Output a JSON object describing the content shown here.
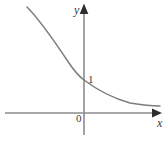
{
  "figure": {
    "width": 168,
    "height": 141,
    "background_color": "#ffffff"
  },
  "labels": {
    "y_axis": "y",
    "x_axis": "x",
    "y_intercept": "1",
    "origin": "0"
  },
  "colors": {
    "axis": "#8c8c8c",
    "arrow": "#2e2e2e",
    "curve": "#7d7d7d",
    "text": "#3a3a3a"
  },
  "chart_data": {
    "type": "line",
    "title": "",
    "subtitle": "",
    "xlabel": "x",
    "ylabel": "y",
    "grid": false,
    "legend": null,
    "annotations": [
      {
        "text": "1",
        "x": 0,
        "y": 1,
        "note": "y-intercept marked on y-axis"
      },
      {
        "text": "0",
        "x": 0,
        "y": 0,
        "note": "origin marked below x-axis, left of y-axis"
      }
    ],
    "axes": {
      "x_axis_pixel_y": 113,
      "y_axis_pixel_x": 84,
      "x_axis_start_px": 5,
      "x_axis_arrow_px": 161,
      "y_axis_arrow_px": 4,
      "y_axis_end_px": 135,
      "x_tick_labels": [
        "0"
      ],
      "y_tick_labels": [
        "1"
      ],
      "arrows": [
        "x-positive",
        "y-positive"
      ]
    },
    "series": [
      {
        "name": "decaying exponential",
        "description": "y = a^x with 0 < a < 1, passing through (0, 1), asymptotic to the x-axis as x increases",
        "points_pixels": [
          [
            27,
            7
          ],
          [
            34,
            14
          ],
          [
            41,
            22
          ],
          [
            48,
            31
          ],
          [
            55,
            41
          ],
          [
            62,
            52
          ],
          [
            69,
            63
          ],
          [
            76,
            72
          ],
          [
            84,
            80
          ],
          [
            92,
            87
          ],
          [
            100,
            92
          ],
          [
            110,
            97
          ],
          [
            120,
            100
          ],
          [
            132,
            103
          ],
          [
            145,
            105
          ],
          [
            160,
            106
          ]
        ],
        "path_d": "M 27 7 C 40 20, 55 42, 69 63 C 75 72, 80 77, 84 80 C 96 89, 112 98, 130 103 C 142 105, 152 106, 160 106"
      }
    ]
  }
}
